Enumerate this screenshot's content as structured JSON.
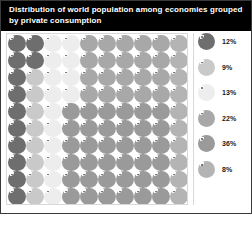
{
  "header": {
    "title": "Distribution of world population among economies grouped\nby private consumption"
  },
  "legend": {
    "items": [
      {
        "label": "12%",
        "color": "#6e6e6e"
      },
      {
        "label": "9%",
        "color": "#c9c9c9"
      },
      {
        "label": "13%",
        "color": "#ededed"
      },
      {
        "label": "22%",
        "color": "#a8a8a8"
      },
      {
        "label": "36%",
        "color": "#9a9a9a"
      },
      {
        "label": "8%",
        "color": "#b4b4b4"
      }
    ]
  },
  "chart_data": {
    "type": "pie",
    "title": "Distribution of world population among economies grouped by private consumption",
    "xlabel": "",
    "ylabel": "",
    "units": "percent of world population",
    "grid": {
      "rows": 10,
      "columns": 10,
      "total_dots": 100,
      "dot_shape": "circle-with-notch"
    },
    "legend_position": "right",
    "categories": [
      "Group 1",
      "Group 2",
      "Group 3",
      "Group 4",
      "Group 5",
      "Group 6"
    ],
    "values": [
      12,
      9,
      13,
      22,
      36,
      8
    ],
    "colors": [
      "#6e6e6e",
      "#c9c9c9",
      "#ededed",
      "#a8a8a8",
      "#9a9a9a",
      "#b4b4b4"
    ],
    "dot_colors": [
      [
        "#6e6e6e",
        "#6e6e6e",
        "#ededed",
        "#ededed",
        "#a8a8a8",
        "#a8a8a8",
        "#a8a8a8",
        "#a8a8a8",
        "#a8a8a8",
        "#b4b4b4"
      ],
      [
        "#6e6e6e",
        "#6e6e6e",
        "#ededed",
        "#ededed",
        "#a8a8a8",
        "#a8a8a8",
        "#a8a8a8",
        "#a8a8a8",
        "#a8a8a8",
        "#b4b4b4"
      ],
      [
        "#6e6e6e",
        "#c9c9c9",
        "#ededed",
        "#ededed",
        "#a8a8a8",
        "#a8a8a8",
        "#a8a8a8",
        "#a8a8a8",
        "#a8a8a8",
        "#b4b4b4"
      ],
      [
        "#6e6e6e",
        "#c9c9c9",
        "#ededed",
        "#ededed",
        "#a8a8a8",
        "#a8a8a8",
        "#a8a8a8",
        "#a8a8a8",
        "#a8a8a8",
        "#b4b4b4"
      ],
      [
        "#6e6e6e",
        "#c9c9c9",
        "#ededed",
        "#9a9a9a",
        "#9a9a9a",
        "#9a9a9a",
        "#9a9a9a",
        "#9a9a9a",
        "#9a9a9a",
        "#b4b4b4"
      ],
      [
        "#6e6e6e",
        "#c9c9c9",
        "#ededed",
        "#9a9a9a",
        "#9a9a9a",
        "#9a9a9a",
        "#9a9a9a",
        "#9a9a9a",
        "#9a9a9a",
        "#b4b4b4"
      ],
      [
        "#6e6e6e",
        "#c9c9c9",
        "#ededed",
        "#9a9a9a",
        "#9a9a9a",
        "#9a9a9a",
        "#9a9a9a",
        "#9a9a9a",
        "#9a9a9a",
        "#b4b4b4"
      ],
      [
        "#6e6e6e",
        "#c9c9c9",
        "#ededed",
        "#9a9a9a",
        "#9a9a9a",
        "#9a9a9a",
        "#9a9a9a",
        "#9a9a9a",
        "#9a9a9a",
        "#b4b4b4"
      ],
      [
        "#6e6e6e",
        "#c9c9c9",
        "#ededed",
        "#9a9a9a",
        "#9a9a9a",
        "#9a9a9a",
        "#9a9a9a",
        "#9a9a9a",
        "#9a9a9a",
        "#b4b4b4"
      ],
      [
        "#6e6e6e",
        "#c9c9c9",
        "#ededed",
        "#9a9a9a",
        "#9a9a9a",
        "#9a9a9a",
        "#9a9a9a",
        "#9a9a9a",
        "#9a9a9a",
        "#b4b4b4"
      ]
    ]
  }
}
